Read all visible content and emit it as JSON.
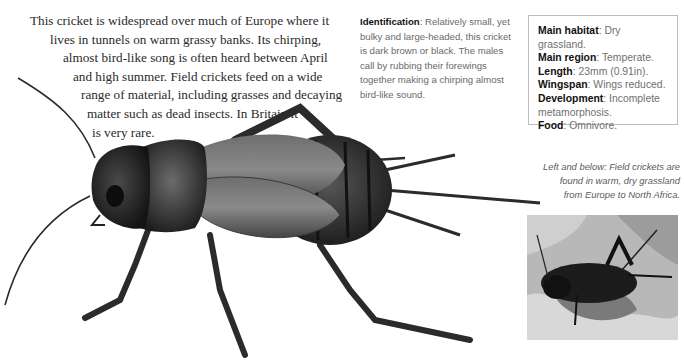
{
  "intro": {
    "lines": [
      "This cricket is widespread over much of Europe where it",
      "lives in tunnels on warm grassy banks. Its chirping,",
      "almost bird-like song is often heard between April",
      "and high summer. Field crickets feed on a wide",
      "range of material, including grasses and decaying",
      "matter such as dead insects. In Britain it",
      "is very rare."
    ]
  },
  "identification": {
    "label": "Identification",
    "text": ": Relatively small, yet bulky and large-headed, this cricket is dark brown or black. The males call by rubbing their forewings together making a chirping almost bird-like sound."
  },
  "facts": [
    {
      "label": "Main habitat",
      "value": ": Dry grassland."
    },
    {
      "label": "Main region",
      "value": ": Temperate."
    },
    {
      "label": "Length",
      "value": ": 23mm (0.91in)."
    },
    {
      "label": "Wingspan",
      "value": ": Wings reduced."
    },
    {
      "label": "Development",
      "value": ": Incomplete metamorphosis."
    },
    {
      "label": "Food",
      "value": ": Omnivore."
    }
  ],
  "caption": {
    "lines": [
      "Left and below: Field crickets are",
      "found in warm, dry grassland",
      "from Europe to North Africa."
    ]
  },
  "images": {
    "illustration": "field-cricket-illustration",
    "photo": "field-cricket-photo"
  }
}
